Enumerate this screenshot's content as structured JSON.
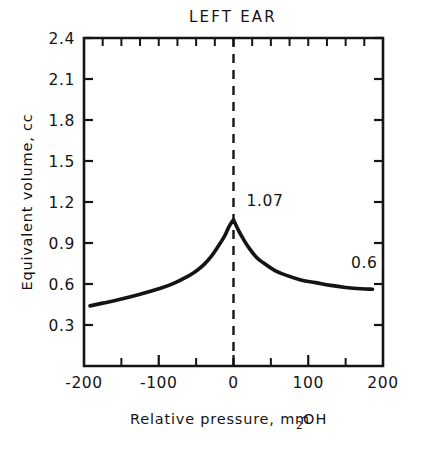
{
  "chart_data": {
    "type": "line",
    "title": "LEFT EAR",
    "xlabel_main": "Relative pressure, mm H",
    "xlabel_sub": "2",
    "xlabel_tail": "O",
    "xlabel_full": "Relative pressure, mm H2O",
    "ylabel": "Equivalent volume, cc",
    "xlim": [
      -200,
      200
    ],
    "ylim": [
      0,
      2.4
    ],
    "grid": false,
    "legend": null,
    "x_major_ticks": [
      -200,
      -100,
      0,
      100,
      200
    ],
    "x_major_tick_labels": [
      "-200",
      "-100",
      "0",
      "100",
      "200"
    ],
    "x_minor_tick_step": 50,
    "y_major_ticks": [
      0.3,
      0.6,
      0.9,
      1.2,
      1.5,
      1.8,
      2.1,
      2.4
    ],
    "y_major_tick_labels": [
      "0.3",
      "0.6",
      "0.9",
      "1.2",
      "1.5",
      "1.8",
      "2.1",
      "2.4"
    ],
    "reference_line": {
      "orientation": "vertical",
      "x": 0,
      "style": "dashed"
    },
    "annotations": [
      {
        "text": "1.07",
        "x": 0,
        "y": 1.07,
        "note": "peak value at zero pressure"
      },
      {
        "text": "0.6",
        "x": 175,
        "y": 0.72,
        "note": "tail value label"
      }
    ],
    "series": [
      {
        "name": "Tympanogram left ear",
        "x": [
          -192,
          -175,
          -150,
          -125,
          -100,
          -80,
          -60,
          -50,
          -40,
          -30,
          -20,
          -12,
          -6,
          0,
          6,
          12,
          20,
          30,
          40,
          55,
          70,
          90,
          110,
          130,
          150,
          170,
          186
        ],
        "y": [
          0.44,
          0.46,
          0.49,
          0.525,
          0.565,
          0.605,
          0.66,
          0.695,
          0.74,
          0.8,
          0.88,
          0.95,
          1.02,
          1.07,
          1.0,
          0.94,
          0.87,
          0.8,
          0.755,
          0.7,
          0.665,
          0.63,
          0.61,
          0.59,
          0.575,
          0.565,
          0.562
        ]
      }
    ]
  },
  "layout": {
    "plot_left_px": 84,
    "plot_right_px": 383,
    "plot_top_px": 38,
    "plot_bottom_px": 366
  }
}
